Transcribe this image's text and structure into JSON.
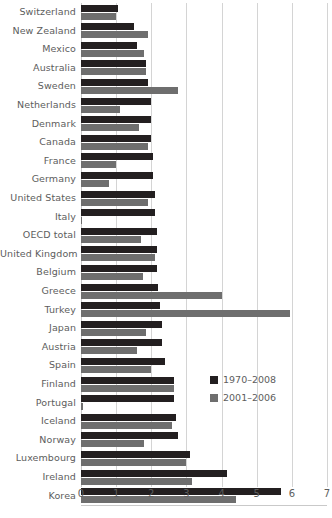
{
  "chart_data": {
    "type": "bar",
    "orientation": "horizontal",
    "title": "",
    "subtitle": "",
    "xlabel": "",
    "ylabel": "",
    "xlim": [
      0,
      7
    ],
    "xticks": [
      0,
      1,
      2,
      3,
      4,
      5,
      6,
      7
    ],
    "xticklabels": [
      "0",
      "1",
      "2",
      "3",
      "4",
      "5",
      "6",
      "7"
    ],
    "grid": "vertical",
    "legend_position": "inside-right",
    "categories": [
      "Switzerland",
      "New Zealand",
      "Mexico",
      "Australia",
      "Sweden",
      "Netherlands",
      "Denmark",
      "Canada",
      "France",
      "Germany",
      "United States",
      "Italy",
      "OECD total",
      "United Kingdom",
      "Belgium",
      "Greece",
      "Turkey",
      "Japan",
      "Austria",
      "Spain",
      "Finland",
      "Portugal",
      "Iceland",
      "Norway",
      "Luxembourg",
      "Ireland",
      "Korea"
    ],
    "series": [
      {
        "name": "1970–2008",
        "color": "#231f20",
        "values": [
          1.05,
          1.5,
          1.6,
          1.85,
          1.9,
          2.0,
          2.0,
          2.0,
          2.05,
          2.05,
          2.1,
          2.1,
          2.15,
          2.15,
          2.15,
          2.2,
          2.25,
          2.3,
          2.3,
          2.4,
          2.65,
          2.65,
          2.7,
          2.75,
          3.1,
          4.15,
          5.7
        ]
      },
      {
        "name": "2001–2006",
        "color": "#6e6e6e",
        "values": [
          1.0,
          1.9,
          1.8,
          1.85,
          2.75,
          1.1,
          1.65,
          1.9,
          1.0,
          0.8,
          1.9,
          0.03,
          1.7,
          2.1,
          1.75,
          4.0,
          5.95,
          1.85,
          1.6,
          2.0,
          2.65,
          0.05,
          2.6,
          1.8,
          3.0,
          3.15,
          4.4
        ]
      }
    ]
  },
  "legend": {
    "items": [
      {
        "label": "1970–2008",
        "color": "#231f20"
      },
      {
        "label": "2001–2006",
        "color": "#6e6e6e"
      }
    ]
  }
}
